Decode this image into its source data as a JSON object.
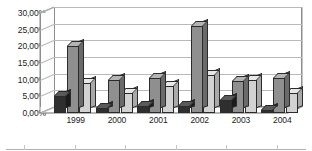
{
  "chart_data": {
    "type": "bar",
    "title": "",
    "subtitle": "",
    "xlabel": "",
    "ylabel": "",
    "categories": [
      "1999",
      "2000",
      "2001",
      "2002",
      "2003",
      "2004"
    ],
    "series": [
      {
        "name": "Series 1",
        "color": "#2f2f2f",
        "values": [
          5.0,
          1.5,
          2.0,
          2.0,
          4.0,
          1.0
        ]
      },
      {
        "name": "Series 2",
        "color": "#8f8f8f",
        "values": [
          20.0,
          10.0,
          10.5,
          26.0,
          9.5,
          10.5
        ]
      },
      {
        "name": "Series 3",
        "color": "#d2d2d2",
        "values": [
          9.0,
          6.0,
          8.0,
          11.5,
          10.0,
          6.0
        ]
      }
    ],
    "ylim": [
      0,
      30
    ],
    "ytick_values": [
      0,
      5,
      10,
      15,
      20,
      25,
      30
    ],
    "ytick_labels": [
      "0,00%",
      "5,00%",
      "10,00%",
      "15,00%",
      "20,00%",
      "25,00%",
      "30,00%"
    ],
    "grid": true,
    "legend": "none",
    "three_d": true,
    "decimal_separator": ",",
    "unit": "%"
  },
  "axes": {
    "y_axis_name": "value-axis",
    "x_axis_name": "category-axis"
  },
  "footer": {
    "rule_present": true,
    "tick_count": 6
  }
}
